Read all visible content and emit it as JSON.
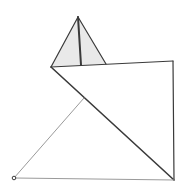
{
  "diagram": {
    "width": 185,
    "height": 190,
    "background": "#ffffff",
    "colors": {
      "dark_stroke": "#3a3a3a",
      "light_stroke": "#9a9a9a",
      "shade_fill": "#e9e9e9"
    },
    "points": {
      "apex": [
        78,
        17
      ],
      "left_vertex": [
        51,
        67
      ],
      "mid_base": [
        81,
        65
      ],
      "tri_right": [
        106,
        64
      ],
      "top_right": [
        173,
        61
      ],
      "bottom_right": [
        174,
        180
      ],
      "bottom_left": [
        14,
        178
      ],
      "diag_intersect": [
        84,
        98
      ]
    },
    "shaded_triangle": [
      "apex",
      "left_vertex",
      "tri_right"
    ],
    "segments": [
      {
        "from": "apex",
        "to": "left_vertex",
        "style": "dark",
        "width": 1.2
      },
      {
        "from": "apex",
        "to": "tri_right",
        "style": "dark",
        "width": 1.2
      },
      {
        "from": "apex",
        "to": "mid_base",
        "style": "dark",
        "width": 2
      },
      {
        "from": "left_vertex",
        "to": "top_right",
        "style": "dark",
        "width": 1.2
      },
      {
        "from": "top_right",
        "to": "bottom_right",
        "style": "dark",
        "width": 1.2
      },
      {
        "from": "left_vertex",
        "to": "bottom_right",
        "style": "dark",
        "width": 1.6
      },
      {
        "from": "bottom_left",
        "to": "bottom_right",
        "style": "light",
        "width": 1
      },
      {
        "from": "bottom_left",
        "to": "diag_intersect",
        "style": "light",
        "width": 1
      }
    ],
    "markers": [
      {
        "at": "bottom_left",
        "shape": "open-circle",
        "r": 1.8
      }
    ]
  }
}
